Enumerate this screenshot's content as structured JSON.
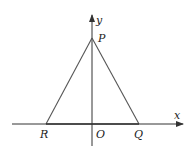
{
  "diagram": {
    "axes": {
      "x_label": "x",
      "y_label": "y",
      "origin_label": "O"
    },
    "points": {
      "P": {
        "label": "P",
        "location": "on positive y-axis"
      },
      "Q": {
        "label": "Q",
        "location": "on positive x-axis"
      },
      "R": {
        "label": "R",
        "location": "on negative x-axis"
      }
    },
    "segments": [
      "PR",
      "PQ",
      "RQ"
    ],
    "colors": {
      "axis": "#333333",
      "triangle": "#555555",
      "label": "#222222"
    }
  }
}
